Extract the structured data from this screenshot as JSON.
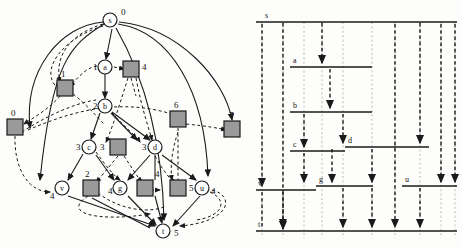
{
  "figure": {
    "title": "",
    "panels": [
      {
        "name": "dependency-graph",
        "caption": ""
      },
      {
        "name": "ladder-timeline",
        "caption": ""
      }
    ]
  },
  "graph": {
    "type": "directed-graph",
    "circle_nodes": [
      {
        "id": "s",
        "label": "s",
        "value": "0",
        "x": 110,
        "y": 20
      },
      {
        "id": "a",
        "label": "a",
        "value": "1",
        "x": 105,
        "y": 67
      },
      {
        "id": "b",
        "label": "b",
        "value": "2",
        "x": 105,
        "y": 106
      },
      {
        "id": "c",
        "label": "c",
        "value": "3",
        "x": 89,
        "y": 147
      },
      {
        "id": "d",
        "label": "d",
        "value": "3",
        "x": 155,
        "y": 147
      },
      {
        "id": "v",
        "label": "v",
        "value": "4",
        "x": 62,
        "y": 188
      },
      {
        "id": "g",
        "label": "g",
        "value": "4",
        "x": 120,
        "y": 188
      },
      {
        "id": "u",
        "label": "u",
        "value": "4",
        "x": 202,
        "y": 188
      },
      {
        "id": "t",
        "label": "t",
        "value": "5",
        "x": 163,
        "y": 231
      }
    ],
    "square_nodes": [
      {
        "id": "sq0",
        "value": "0",
        "x": 15,
        "y": 127
      },
      {
        "id": "sq1",
        "value": "1",
        "x": 65,
        "y": 88
      },
      {
        "id": "sq4t",
        "value": "4",
        "x": 131,
        "y": 69
      },
      {
        "id": "sq6",
        "value": "6",
        "x": 178,
        "y": 119
      },
      {
        "id": "sq7",
        "value": "7",
        "x": 232,
        "y": 129
      },
      {
        "id": "sq3",
        "value": "3",
        "x": 118,
        "y": 147
      },
      {
        "id": "sq2",
        "value": "2",
        "x": 91,
        "y": 188
      },
      {
        "id": "sq4b",
        "value": "4",
        "x": 145,
        "y": 188
      },
      {
        "id": "sq5",
        "value": "5",
        "x": 178,
        "y": 188
      }
    ],
    "node_values": [
      "0",
      "1",
      "2",
      "3",
      "3",
      "4",
      "4",
      "4",
      "5",
      "0",
      "1",
      "4",
      "6",
      "7",
      "3",
      "2",
      "4",
      "5"
    ],
    "edge_styles": {
      "solid": "process edge",
      "dashed": "message edge"
    }
  },
  "timeline": {
    "type": "ladder-diagram",
    "lanes": [
      {
        "id": "s",
        "label": "s",
        "row": 0
      },
      {
        "id": "a",
        "label": "a",
        "row": 1
      },
      {
        "id": "b",
        "label": "b",
        "row": 2
      },
      {
        "id": "c",
        "label": "c",
        "row": 3
      },
      {
        "id": "d",
        "label": "d",
        "row": 3
      },
      {
        "id": "v",
        "label": "v",
        "row": 4
      },
      {
        "id": "g",
        "label": "g",
        "row": 4
      },
      {
        "id": "u",
        "label": "u",
        "row": 4
      },
      {
        "id": "t",
        "label": "t",
        "row": 5
      }
    ],
    "lane_labels": [
      "s",
      "a",
      "b",
      "c",
      "d",
      "v",
      "g",
      "u",
      "t"
    ]
  },
  "colors": {
    "ink": "#1a1a1a",
    "square_fill": "#9a9a9a",
    "square_stroke": "#1a1a1a",
    "circle_fill": "#ffffff",
    "paper": "#fdfdfb",
    "dash_gray": "#8a8a8a"
  }
}
